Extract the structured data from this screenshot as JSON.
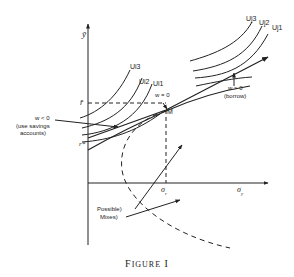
{
  "figure": {
    "caption_first": "F",
    "caption_rest": "IGURE",
    "caption_num": "I",
    "axes": {
      "y_label": "ȳ",
      "x_label": "σy",
      "x_label_sym": "σ",
      "x_label_sub": "y",
      "r_bar": "r̄",
      "r_star": "r*",
      "sigma_r": "σ",
      "sigma_r_sub": "r"
    },
    "point_M": "M",
    "indifference_curves_left": [
      "Ui3",
      "Ui2",
      "Ui1"
    ],
    "indifference_curves_right": [
      "Uj3",
      "Uj2",
      "Uj1"
    ],
    "annotations": {
      "w_zero": "w = 0",
      "w_pos": "w > 0",
      "borrow": "(borrow)",
      "w_neg": "w < 0",
      "savings_1": "(use savings",
      "savings_2": "accounts)",
      "possible": "Possible)",
      "mixes": "Mixes)"
    },
    "colors": {
      "ink": "#222222",
      "background": "#ffffff"
    }
  }
}
